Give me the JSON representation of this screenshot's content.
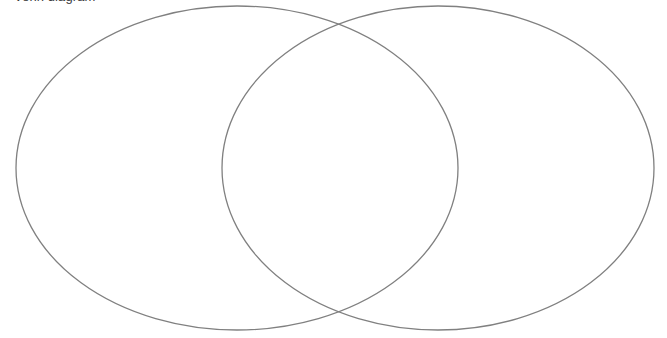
{
  "canvas": {
    "width": 667,
    "height": 338,
    "background_color": "#ffffff"
  },
  "title": {
    "text": "Venn diagram",
    "color": "#3a3a3a",
    "clipped_at_top": true
  },
  "chart_data": {
    "type": "diagram",
    "diagram_type": "venn",
    "title": "Venn diagram",
    "set_count": 2,
    "labels": [],
    "region_labels": [],
    "legend": [],
    "stroke_color": "#808080",
    "stroke_width": 1.3,
    "fill": "none",
    "background": "#ffffff",
    "sets": [
      {
        "name": "left-set",
        "label": "",
        "cx": 237,
        "cy": 168,
        "rx": 221,
        "ry": 162,
        "stroke": "#808080",
        "fill": "none"
      },
      {
        "name": "right-set",
        "label": "",
        "cx": 438,
        "cy": 168,
        "rx": 216,
        "ry": 162,
        "stroke": "#808080",
        "fill": "none"
      }
    ],
    "intersections": [
      {
        "name": "upper-crossing",
        "x": 340,
        "y": 22
      },
      {
        "name": "lower-crossing",
        "x": 340,
        "y": 313
      }
    ],
    "regions": [
      {
        "name": "left-only",
        "label": ""
      },
      {
        "name": "intersection",
        "label": ""
      },
      {
        "name": "right-only",
        "label": ""
      }
    ],
    "xlim": [
      0,
      667
    ],
    "ylim": [
      0,
      338
    ],
    "grid": false
  }
}
